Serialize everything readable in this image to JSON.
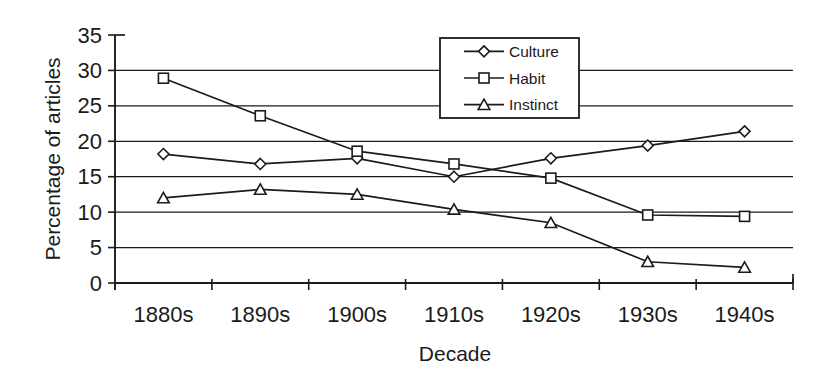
{
  "figure": {
    "background_color": "#ffffff",
    "ink_color": "#1b1b1b"
  },
  "chart_data": {
    "type": "line",
    "title": "",
    "xlabel": "Decade",
    "ylabel": "Percentage of articles",
    "categories": [
      "1880s",
      "1890s",
      "1900s",
      "1910s",
      "1920s",
      "1930s",
      "1940s"
    ],
    "series": [
      {
        "name": "Culture",
        "marker": "diamond",
        "values": [
          18.2,
          16.8,
          17.6,
          15.0,
          17.6,
          19.4,
          21.4
        ]
      },
      {
        "name": "Habit",
        "marker": "square",
        "values": [
          28.9,
          23.6,
          18.6,
          16.8,
          14.8,
          9.6,
          9.4
        ]
      },
      {
        "name": "Instinct",
        "marker": "triangle",
        "values": [
          12.0,
          13.2,
          12.5,
          10.4,
          8.5,
          3.0,
          2.2
        ]
      }
    ],
    "ylim": [
      0,
      35
    ],
    "yticks": [
      0,
      5,
      10,
      15,
      20,
      25,
      30,
      35
    ],
    "grid": "horizontal",
    "legend": {
      "position": "top-center-right",
      "entries": [
        "Culture",
        "Habit",
        "Instinct"
      ],
      "markers": [
        "diamond",
        "square",
        "triangle"
      ]
    },
    "line_color": "#1b1b1b",
    "marker_fill": "#ffffff",
    "background": "#ffffff"
  }
}
